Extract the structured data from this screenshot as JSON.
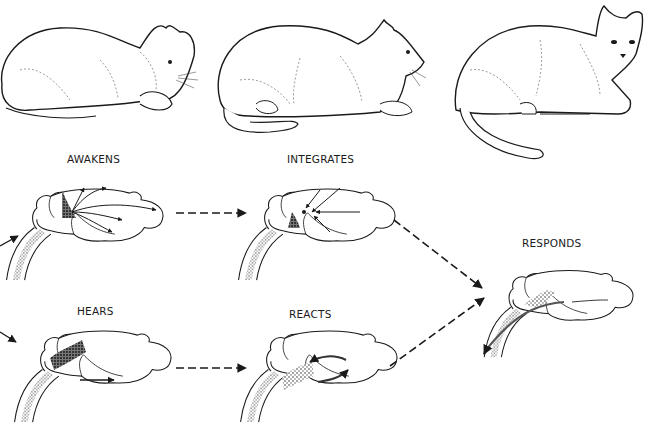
{
  "stages": [
    {
      "id": "awakens",
      "label": "AWAKENS"
    },
    {
      "id": "integrates",
      "label": "INTEGRATES"
    },
    {
      "id": "responds",
      "label": "RESPONDS"
    },
    {
      "id": "hears",
      "label": "HEARS"
    },
    {
      "id": "reacts",
      "label": "REACTS"
    }
  ],
  "cats": [
    {
      "id": "cat-1",
      "pose": "resting, head lowered"
    },
    {
      "id": "cat-2",
      "pose": "alert, head raised"
    },
    {
      "id": "cat-3",
      "pose": "turned toward viewer, tail extended"
    }
  ],
  "colors": {
    "ink": "#1a1a1a",
    "background": "#ffffff",
    "stipple": "#555555"
  }
}
